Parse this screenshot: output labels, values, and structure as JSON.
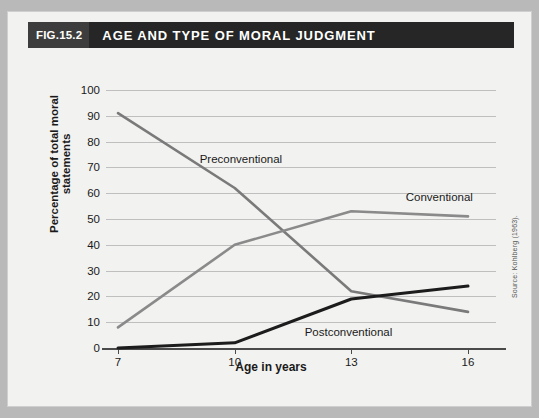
{
  "figure": {
    "number": "FIG.15.2",
    "title": "AGE AND TYPE OF MORAL JUDGMENT",
    "source": "Source: Kohlberg (1963)."
  },
  "colors": {
    "header_bg": "#262626",
    "header_badge_bg": "#3d3d3d",
    "page_bg": "#b9b9b9",
    "panel_bg": "#f2f2f0",
    "grid": "#bfbfbf",
    "preconventional": "#7a7a7a",
    "conventional": "#8a8a8a",
    "postconventional": "#1c1c1c"
  },
  "chart_data": {
    "type": "line",
    "title": "AGE AND TYPE OF MORAL JUDGMENT",
    "xlabel": "Age in years",
    "ylabel": "Percentage of total moral statements",
    "x": [
      7,
      10,
      13,
      16
    ],
    "xtick_labels": [
      "7",
      "10",
      "13",
      "16"
    ],
    "ytick_labels": [
      "0",
      "10",
      "20",
      "30",
      "40",
      "50",
      "60",
      "70",
      "80",
      "90",
      "100"
    ],
    "yticks": [
      0,
      10,
      20,
      30,
      40,
      50,
      60,
      70,
      80,
      90,
      100
    ],
    "ylim": [
      0,
      100
    ],
    "xlim": [
      7,
      16
    ],
    "grid": true,
    "legend": "inline-annotations",
    "series": [
      {
        "name": "Preconventional",
        "values": [
          91,
          62,
          22,
          14
        ]
      },
      {
        "name": "Conventional",
        "values": [
          8,
          40,
          53,
          51
        ]
      },
      {
        "name": "Postconventional",
        "values": [
          0,
          2,
          19,
          24
        ]
      }
    ],
    "annotations": [
      {
        "text": "Preconventional",
        "x": 9.1,
        "y": 73
      },
      {
        "text": "Conventional",
        "x": 14.4,
        "y": 58
      },
      {
        "text": "Postconventional",
        "x": 11.8,
        "y": 6
      }
    ]
  }
}
